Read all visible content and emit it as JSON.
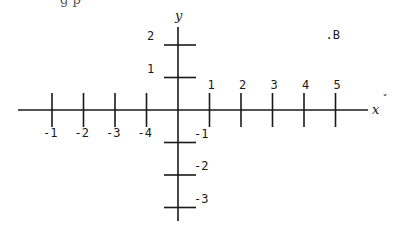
{
  "header_fragment": "g p",
  "axes": {
    "x_name": "x",
    "y_name": "y",
    "x_name_mark": "ˇ"
  },
  "x_ticks": [
    {
      "value": 1,
      "label": "1",
      "side": "above"
    },
    {
      "value": 2,
      "label": "2",
      "side": "above"
    },
    {
      "value": 3,
      "label": "3",
      "side": "above"
    },
    {
      "value": 4,
      "label": "4",
      "side": "above"
    },
    {
      "value": 5,
      "label": "5",
      "side": "above"
    },
    {
      "value": -1,
      "label": "-4",
      "side": "below"
    },
    {
      "value": -2,
      "label": "-3",
      "side": "below"
    },
    {
      "value": -3,
      "label": "-2",
      "side": "below"
    },
    {
      "value": -4,
      "label": "-1",
      "side": "below"
    }
  ],
  "y_ticks": [
    {
      "value": 2,
      "label": "2",
      "side": "left"
    },
    {
      "value": 1,
      "label": "1",
      "side": "left"
    },
    {
      "value": -1,
      "label": "-1",
      "side": "right"
    },
    {
      "value": -2,
      "label": "-2",
      "side": "right"
    },
    {
      "value": -3,
      "label": "-3",
      "side": "right"
    }
  ],
  "points": [
    {
      "name": "B",
      "label": ".B",
      "x": 5,
      "y": 2.3
    }
  ]
}
